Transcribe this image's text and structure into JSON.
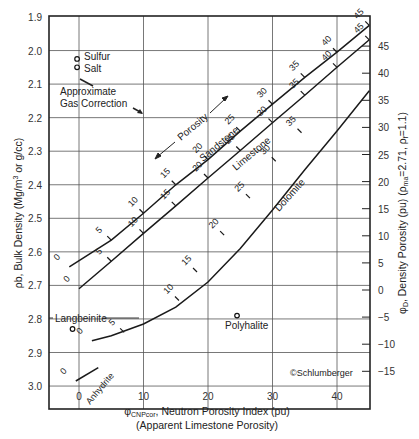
{
  "chart_data": {
    "type": "line",
    "title": "",
    "xlabel": "φCNPcor, Neutron Porosity Index (pu)",
    "xlabel_sub": "(Apparent Limestone Porosity)",
    "ylabel": "ρb, Bulk Density (Mg/m³ or g/cc)",
    "y2label": "φD, Density Porosity (pu) (ρma=2.71, ρf=1.1)",
    "xlim": [
      -5,
      45
    ],
    "ylim": [
      3.07,
      1.9
    ],
    "y_inverted": true,
    "x_ticks": [
      0,
      10,
      20,
      30,
      40
    ],
    "y_ticks": [
      1.9,
      2.0,
      2.1,
      2.2,
      2.3,
      2.4,
      2.5,
      2.6,
      2.7,
      2.8,
      2.9,
      3.0
    ],
    "y2_ticks": [
      45,
      40,
      35,
      30,
      25,
      20,
      15,
      10,
      5,
      0,
      -5,
      -10,
      -15
    ],
    "grid": true,
    "series": [
      {
        "name": "Sandstone",
        "points": [
          [
            -1.5,
            2.645
          ],
          [
            5,
            2.565
          ],
          [
            10,
            2.485
          ],
          [
            15,
            2.4
          ],
          [
            20,
            2.325
          ],
          [
            25,
            2.24
          ],
          [
            30,
            2.16
          ],
          [
            35,
            2.08
          ],
          [
            40,
            2.005
          ],
          [
            45,
            1.925
          ]
        ],
        "labels": [
          0,
          5,
          10,
          15,
          20,
          25,
          30,
          35,
          40,
          45
        ]
      },
      {
        "name": "Limestone",
        "points": [
          [
            0,
            2.71
          ],
          [
            5,
            2.628
          ],
          [
            10,
            2.545
          ],
          [
            15,
            2.463
          ],
          [
            20,
            2.38
          ],
          [
            25,
            2.298
          ],
          [
            30,
            2.215
          ],
          [
            35,
            2.133
          ],
          [
            40,
            2.05
          ],
          [
            45,
            1.968
          ]
        ],
        "labels": [
          0,
          5,
          10,
          15,
          20,
          25,
          30,
          35,
          40,
          45
        ]
      },
      {
        "name": "Dolomite",
        "points": [
          [
            2,
            2.865
          ],
          [
            5,
            2.85
          ],
          [
            10,
            2.815
          ],
          [
            15,
            2.765
          ],
          [
            20,
            2.69
          ],
          [
            25,
            2.59
          ],
          [
            30,
            2.475
          ],
          [
            35,
            2.355
          ],
          [
            40,
            2.24
          ],
          [
            45,
            2.12
          ]
        ],
        "labels": [
          0,
          5,
          10,
          15,
          20,
          25,
          30,
          35
        ],
        "label_points": [
          [
            2,
            2.865
          ],
          [
            7,
            2.84
          ],
          [
            15.5,
            2.745
          ],
          [
            18.3,
            2.66
          ],
          [
            22.5,
            2.55
          ],
          [
            26.5,
            2.44
          ],
          [
            30.5,
            2.33
          ],
          [
            34.5,
            2.245
          ]
        ]
      },
      {
        "name": "Anhydrite",
        "points": [
          [
            -0.5,
            2.985
          ],
          [
            3,
            2.945
          ]
        ],
        "labels": [
          0
        ]
      }
    ],
    "points": [
      {
        "name": "Sulfur",
        "x": -0.3,
        "y": 2.025
      },
      {
        "name": "Salt",
        "x": -0.3,
        "y": 2.05
      },
      {
        "name": "Langbeinite",
        "x": -1,
        "y": 2.83
      },
      {
        "name": "Polyhalite",
        "x": 24.5,
        "y": 2.79
      }
    ],
    "annotations": [
      "Approximate Gas Correction",
      "Porosity",
      "©Schlumberger"
    ]
  },
  "labels": {
    "sulfur": "Sulfur",
    "salt": "Salt",
    "gas_correction_line1": "Approximate",
    "gas_correction_line2": "Gas Correction",
    "porosity": "Porosity",
    "sandstone": "Sandstone",
    "limestone": "Limestone",
    "dolomite": "Dolomite",
    "anhydrite": "Anhydrite",
    "langbeinite": "Langbeinite",
    "polyhalite": "Polyhalite",
    "copyright": "©Schlumberger"
  }
}
